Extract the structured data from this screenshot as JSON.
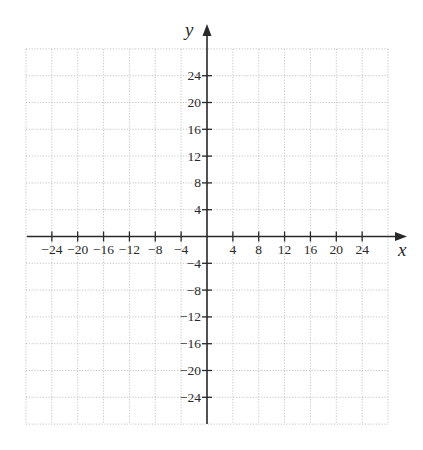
{
  "chart_data": {
    "type": "scatter",
    "title": "",
    "xlabel": "x",
    "ylabel": "y",
    "xlim": [
      -28,
      28
    ],
    "ylim": [
      -28,
      28
    ],
    "grid": true,
    "grid_step": 4,
    "grid_style": "dotted",
    "x_ticks": [
      -24,
      -20,
      -16,
      -12,
      -8,
      -4,
      4,
      8,
      12,
      16,
      20,
      24
    ],
    "y_ticks": [
      24,
      20,
      16,
      12,
      8,
      4,
      -4,
      -8,
      -12,
      -16,
      -20,
      -24
    ],
    "x_tick_labels": [
      "−24",
      "−20",
      "−16",
      "−12",
      "−8",
      "−4",
      "4",
      "8",
      "12",
      "16",
      "20",
      "24"
    ],
    "y_tick_labels": [
      "24",
      "20",
      "16",
      "12",
      "8",
      "4",
      "−4",
      "−8",
      "−12",
      "−16",
      "−20",
      "−24"
    ],
    "series": [],
    "legend": null
  },
  "layout": {
    "origin_px": [
      207,
      236.5
    ],
    "x_px_per_unit": 6.465,
    "y_px_per_unit": 6.7,
    "x_axis_extent_px": [
      27,
      407
    ],
    "y_axis_extent_px": [
      24,
      424
    ],
    "colors": {
      "axis": "#2a2a2a",
      "grid": "#b8b8b8",
      "background": "#ffffff"
    }
  }
}
